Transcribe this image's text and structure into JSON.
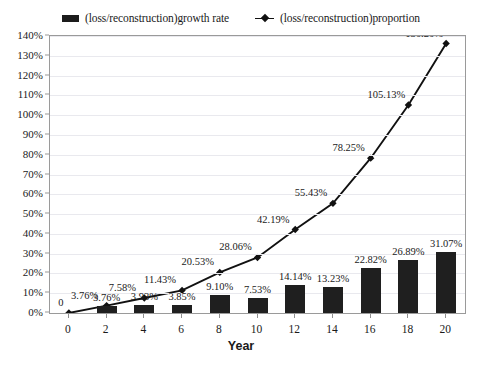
{
  "legend": {
    "items": [
      {
        "label": "(loss/reconstruction)growth rate",
        "marker": "bar-swatch-icon",
        "color": "#1c1c1c"
      },
      {
        "label": "(loss/reconstruction)proportion",
        "marker": "line-marker-icon",
        "color": "#111111"
      }
    ]
  },
  "axes": {
    "x_title": "Year",
    "y_ticks": [
      "0%",
      "10%",
      "20%",
      "30%",
      "40%",
      "50%",
      "60%",
      "70%",
      "80%",
      "90%",
      "100%",
      "110%",
      "120%",
      "130%",
      "140%"
    ],
    "x_ticks": [
      "0",
      "2",
      "4",
      "6",
      "8",
      "10",
      "12",
      "14",
      "16",
      "18",
      "20"
    ]
  },
  "labels": {
    "bars": [
      "3.76%",
      "3.93%",
      "3.85%",
      "9.10%",
      "7.53%",
      "14.14%",
      "13.23%",
      "22.82%",
      "26.89%",
      "31.07%"
    ],
    "line": [
      "0",
      "7.58%",
      "11.43%",
      "20.53%",
      "28.06%",
      "42.19%",
      "55.43%",
      "78.25%",
      "105.13%",
      "136.20%"
    ]
  },
  "chart_data": {
    "type": "bar",
    "title": "",
    "xlabel": "Year",
    "ylabel": "",
    "categories": [
      0,
      2,
      4,
      6,
      8,
      10,
      12,
      14,
      16,
      18,
      20
    ],
    "ylim": [
      0,
      140
    ],
    "ytick_step": 10,
    "grid": true,
    "legend_position": "top-center",
    "series": [
      {
        "name": "(loss/reconstruction)growth rate",
        "type": "bar",
        "color": "#1f1f1f",
        "x": [
          2,
          4,
          6,
          8,
          10,
          12,
          14,
          16,
          18,
          20
        ],
        "values": [
          3.76,
          3.93,
          3.85,
          9.1,
          7.53,
          14.14,
          13.23,
          22.82,
          26.89,
          31.07
        ],
        "value_labels": [
          "3.76%",
          "3.93%",
          "3.85%",
          "9.10%",
          "7.53%",
          "14.14%",
          "13.23%",
          "22.82%",
          "26.89%",
          "31.07%"
        ]
      },
      {
        "name": "(loss/reconstruction)proportion",
        "type": "line",
        "color": "#111111",
        "marker": "diamond",
        "x": [
          0,
          2,
          4,
          6,
          8,
          10,
          12,
          14,
          16,
          18,
          20
        ],
        "values": [
          0,
          3.76,
          7.58,
          11.43,
          20.53,
          28.06,
          42.19,
          55.43,
          78.25,
          105.13,
          136.2
        ],
        "value_labels": [
          "0",
          "3.76%",
          "7.58%",
          "11.43%",
          "20.53%",
          "28.06%",
          "42.19%",
          "55.43%",
          "78.25%",
          "105.13%",
          "136.20%"
        ]
      }
    ]
  }
}
